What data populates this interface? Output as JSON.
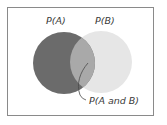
{
  "diagram": {
    "type": "venn",
    "sets": [
      {
        "id": "A",
        "label": "P(A)",
        "color": "#6b6b6b"
      },
      {
        "id": "B",
        "label": "P(B)",
        "color": "#e6e6e6"
      }
    ],
    "intersection": {
      "label": "P(A and B)",
      "color": "#a9a9a9"
    },
    "border_color": "#8a8a8a"
  }
}
